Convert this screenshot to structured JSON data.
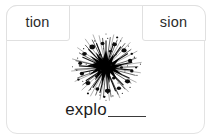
{
  "worksheet": {
    "choices": [
      {
        "label": "tion",
        "position": "top-left"
      },
      {
        "label": "sion",
        "position": "top-right"
      }
    ],
    "illustration": {
      "icon": "explosion-burst-icon",
      "description": "black radial starburst explosion with scattered debris dots"
    },
    "prompt": {
      "word_stem": "explo",
      "blank": ""
    },
    "colors": {
      "card_border": "#e3e3e3",
      "box_border": "#e0e0e0",
      "text": "#2b2b2b",
      "ink": "#111111",
      "background": "#ffffff"
    }
  }
}
